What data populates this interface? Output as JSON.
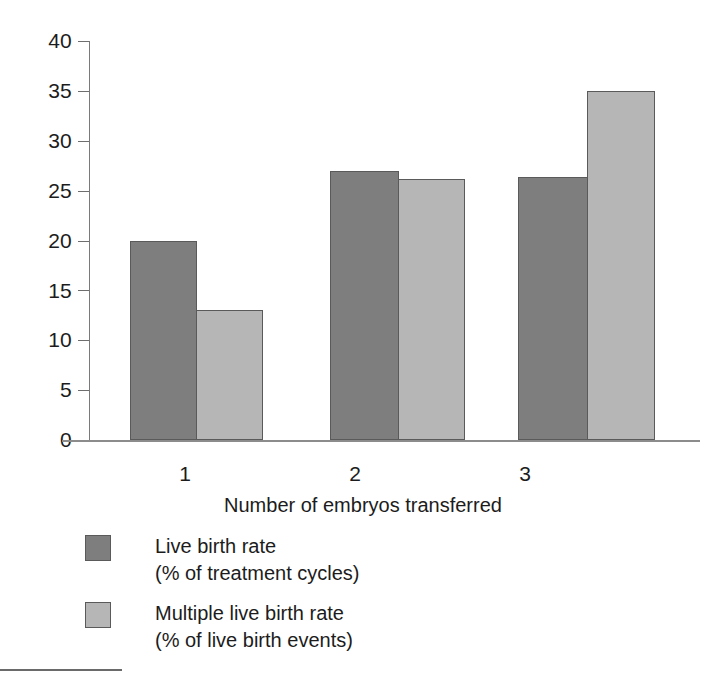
{
  "chart_data": {
    "type": "bar",
    "title": "",
    "subtitle": "",
    "xlabel": "Number of embryos transferred",
    "ylabel": "",
    "categories": [
      "1",
      "2",
      "3"
    ],
    "series": [
      {
        "name": "Live birth rate (% of treatment cycles)",
        "color": "#7e7e7e",
        "values": [
          20,
          27,
          26.4
        ]
      },
      {
        "name": "Multiple live birth rate (% of live birth events)",
        "color": "#b6b6b6",
        "values": [
          13,
          26.2,
          35
        ]
      }
    ],
    "ylim": [
      0,
      40
    ],
    "ytick_labels": [
      "0",
      "5",
      "10",
      "15",
      "20",
      "25",
      "30",
      "35",
      "40"
    ],
    "ytick_values": [
      0,
      5,
      10,
      15,
      20,
      25,
      30,
      35,
      40
    ],
    "xtick_labels": [
      "1",
      "2",
      "3"
    ],
    "grid": false,
    "legend_position": "bottom-left",
    "bar_mode": "grouped-adjacent"
  },
  "axes": {
    "y_labels": [
      "40",
      "35",
      "30",
      "25",
      "20",
      "15",
      "10",
      "5",
      "0"
    ],
    "x_labels": [
      "1",
      "2",
      "3"
    ],
    "x_title": "Number of embryos transferred"
  },
  "legend": {
    "entries": [
      {
        "swatch": "dark-gray-swatch",
        "line1": "Live birth rate",
        "line2": "(% of treatment cycles)"
      },
      {
        "swatch": "light-gray-swatch",
        "line1": "Multiple live birth rate",
        "line2": "(% of live birth events)"
      }
    ]
  },
  "colors": {
    "series_dark": "#7e7e7e",
    "series_light": "#b6b6b6",
    "axis": "#7a7a7a",
    "text": "#1c1c1c",
    "background": "#ffffff"
  }
}
